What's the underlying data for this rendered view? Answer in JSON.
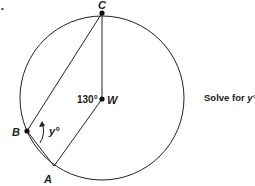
{
  "figure": {
    "bullet": "•",
    "points": {
      "C": {
        "label": "C",
        "x": 102,
        "y": 13
      },
      "W": {
        "label": "W",
        "x": 102,
        "y": 99
      },
      "B": {
        "label": "B",
        "x": 27,
        "y": 131
      },
      "A": {
        "label": "A",
        "x": 54,
        "y": 166
      }
    },
    "circle": {
      "cx": 102,
      "cy": 98,
      "r": 82
    },
    "angle_label": "130°",
    "variable_label": "y°"
  },
  "prompt": {
    "text": "Solve for ",
    "variable": "y°"
  }
}
